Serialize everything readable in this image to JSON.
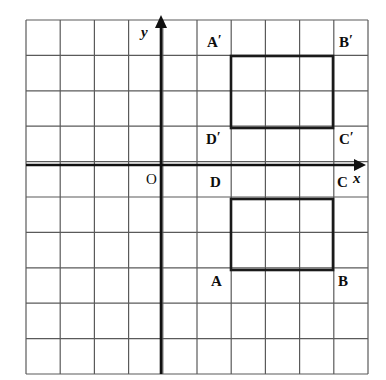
{
  "figure": {
    "type": "coordinate-geometry-diagram",
    "colors": {
      "grid_line": "#5a5a5a",
      "axis_line": "#111111",
      "shape_stroke": "#1a1a1a",
      "background": "#ffffff",
      "label_text": "#0d0d0d"
    },
    "grid": {
      "columns": 10,
      "rows": 10,
      "left": 26,
      "top": 20,
      "right": 368,
      "bottom": 374,
      "cell_width": 34.2,
      "cell_height": 35.4,
      "line_width": 1.2
    },
    "axes": {
      "x_axis": {
        "label": "x",
        "y_pixel": 165,
        "start_x": 26,
        "arrow_tip_x": 366,
        "label_x": 353,
        "label_y": 171,
        "line_width": 2.6
      },
      "y_axis": {
        "label": "y",
        "x_pixel": 161,
        "start_y": 374,
        "arrow_tip_y": 15,
        "label_x": 141,
        "label_y": 25,
        "line_width": 2.6
      },
      "origin": {
        "label": "O",
        "x_pixel": 161,
        "y_pixel": 165,
        "label_x": 146,
        "label_y": 172
      }
    },
    "shapes": [
      {
        "name": "rectangle-image",
        "id": "A'B'C'D'",
        "left": 231,
        "top": 56,
        "right": 333,
        "bottom": 128,
        "stroke_width": 2.6,
        "vertices": [
          {
            "label": "A",
            "prime": "′",
            "corner": "top-left",
            "label_x": 207,
            "label_y": 35
          },
          {
            "label": "B",
            "prime": "′",
            "corner": "top-right",
            "label_x": 339,
            "label_y": 35
          },
          {
            "label": "C",
            "prime": "′",
            "corner": "bottom-right",
            "label_x": 339,
            "label_y": 132
          },
          {
            "label": "D",
            "prime": "′",
            "corner": "bottom-left",
            "label_x": 206,
            "label_y": 132
          }
        ]
      },
      {
        "name": "rectangle-preimage",
        "id": "ABCD",
        "left": 231,
        "top": 199,
        "right": 333,
        "bottom": 270,
        "stroke_width": 2.6,
        "vertices": [
          {
            "label": "D",
            "prime": "",
            "corner": "top-left",
            "label_x": 210,
            "label_y": 175
          },
          {
            "label": "C",
            "prime": "",
            "corner": "top-right",
            "label_x": 337,
            "label_y": 175
          },
          {
            "label": "B",
            "prime": "",
            "corner": "bottom-right",
            "label_x": 338,
            "label_y": 274
          },
          {
            "label": "A",
            "prime": "",
            "corner": "bottom-left",
            "label_x": 211,
            "label_y": 274
          }
        ]
      }
    ]
  }
}
